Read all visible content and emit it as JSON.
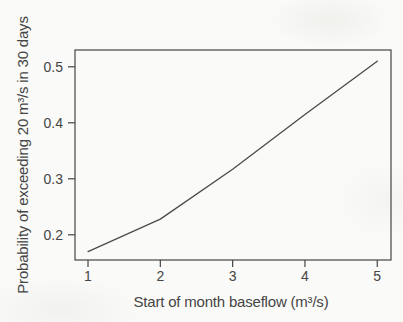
{
  "page": {
    "background": "#fafaf8",
    "ink": "#454545"
  },
  "chart_data": {
    "type": "line",
    "title": "",
    "xlabel": "Start of month baseflow (m³/s)",
    "ylabel": "Probability of exceeding 20 m³/s in 30 days",
    "x": [
      1,
      2,
      3,
      4,
      5
    ],
    "values": [
      0.17,
      0.228,
      0.317,
      0.415,
      0.51
    ],
    "series": [
      {
        "name": "probability of exceeding 20 m³/s in 30 days",
        "values": [
          0.17,
          0.228,
          0.317,
          0.415,
          0.51
        ]
      }
    ],
    "xticks": [
      1,
      2,
      3,
      4,
      5
    ],
    "xtick_labels": [
      "1",
      "2",
      "3",
      "4",
      "5"
    ],
    "yticks": [
      0.2,
      0.3,
      0.4,
      0.5
    ],
    "ytick_labels": [
      "0.2",
      "0.3",
      "0.4",
      "0.5"
    ],
    "xlim": [
      0.82,
      5.19
    ],
    "ylim": [
      0.155,
      0.53
    ],
    "grid": false,
    "legend_position": "none",
    "line_color": "#4a4a4a"
  }
}
